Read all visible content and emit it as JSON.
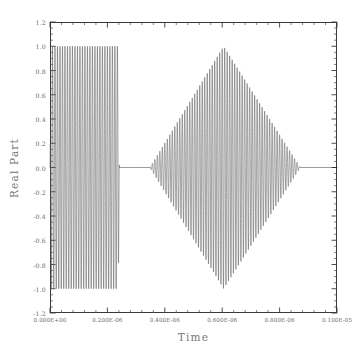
{
  "chart_data": {
    "type": "line",
    "title": "",
    "xlabel": "Time",
    "ylabel": "Real Part",
    "xlim": [
      0.0,
      1e-06
    ],
    "ylim": [
      -1.2,
      1.2
    ],
    "grid": false,
    "legend": null,
    "x_tick_labels": [
      "0.000E+00",
      "0.200E-06",
      "0.400E-06",
      "0.600E-06",
      "0.800E-06",
      "0.100E-05"
    ],
    "x_tick_values": [
      0.0,
      2e-07,
      4e-07,
      6e-07,
      8e-07,
      1e-06
    ],
    "x_minor_per_major": 5,
    "y_tick_labels": [
      "1.2",
      "1.0",
      "0.8",
      "0.6",
      "0.4",
      "0.2",
      "0.0",
      "-0.2",
      "-0.4",
      "-0.6",
      "-0.8",
      "-1.0",
      "-1.2"
    ],
    "y_tick_values": [
      1.2,
      1.0,
      0.8,
      0.6,
      0.4,
      0.2,
      0.0,
      -0.2,
      -0.4,
      -0.6,
      -0.8,
      -1.0,
      -1.2
    ],
    "y_minor_per_major": 4,
    "series": [
      {
        "name": "Real Part",
        "description": "Two modulated carrier wave packets plotted against time",
        "color": "#5a5a5a",
        "carrier_frequency_hz": 115000000.0,
        "packets": [
          {
            "envelope": "rectangular",
            "t_start": 0.0,
            "t_end": 2.42e-07,
            "peak_amplitude": 1.0,
            "edge_taper": 4e-09
          },
          {
            "envelope": "triangular",
            "t_start": 3.48e-07,
            "t_peak": 6.05e-07,
            "t_end": 8.72e-07,
            "peak_amplitude": 1.0
          }
        ],
        "flat_regions": [
          {
            "t_start": 2.42e-07,
            "t_end": 3.48e-07,
            "value": 0.0
          },
          {
            "t_start": 8.72e-07,
            "t_end": 1e-06,
            "value": 0.0
          }
        ]
      }
    ]
  },
  "axis_color": "#3a3a3a",
  "label_color": "#6a6a6a",
  "title_color": "#777777"
}
